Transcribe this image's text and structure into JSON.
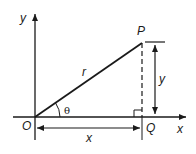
{
  "diagram": {
    "type": "right-triangle-polar-coordinates",
    "colors": {
      "line": "#1a1a1a",
      "background": "#ffffff"
    },
    "axes": {
      "x_label": "x",
      "y_label": "y"
    },
    "points": {
      "origin": {
        "label": "O",
        "px": [
          35,
          117
        ]
      },
      "P": {
        "label": "P",
        "px": [
          142,
          43
        ]
      },
      "Q": {
        "label": "Q",
        "px": [
          142,
          117
        ]
      }
    },
    "labels": {
      "hypotenuse": "r",
      "angle": "θ",
      "horizontal_dimension": "x",
      "vertical_dimension": "y"
    },
    "annotations": {
      "right_angle_at": "Q",
      "PQ_style": "dashed"
    }
  }
}
